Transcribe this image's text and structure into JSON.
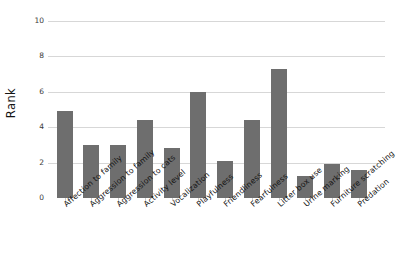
{
  "chart_data": {
    "type": "bar",
    "title": "",
    "xlabel": "",
    "ylabel": "Rank",
    "ylim": [
      0,
      10
    ],
    "yticks": [
      0,
      2,
      4,
      6,
      8,
      10
    ],
    "grid": true,
    "legend": "none",
    "bar_color": "#6e6e6e",
    "categories": [
      "Affection to family",
      "Aggression to family",
      "Aggression to cats",
      "Activity level",
      "Vocalization",
      "Playfulness",
      "Friendliness",
      "Fearfulness",
      "Litter box use",
      "Urine marking",
      "Furniture scratching",
      "Predation"
    ],
    "values": [
      4.9,
      3.0,
      3.0,
      4.4,
      2.8,
      6.0,
      2.1,
      4.4,
      7.3,
      1.25,
      1.95,
      1.6
    ]
  }
}
